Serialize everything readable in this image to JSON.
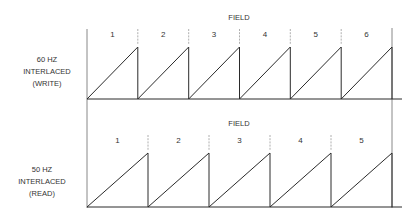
{
  "diagram": {
    "top": {
      "title": "FIELD",
      "side_label": [
        "60  HZ",
        "INTERLACED",
        "(WRITE)"
      ],
      "fields": [
        "1",
        "2",
        "3",
        "4",
        "5",
        "6"
      ]
    },
    "bottom": {
      "title": "FIELD",
      "side_label": [
        "50  HZ",
        "INTERLACED",
        "(READ)"
      ],
      "fields": [
        "1",
        "2",
        "3",
        "4",
        "5"
      ]
    }
  },
  "geometry": {
    "x_start": 87,
    "x_end": 392,
    "axis_extend": 402,
    "top": {
      "baseline": 99,
      "peak": 47,
      "title_y": 20,
      "num_y": 37,
      "div_top": 29,
      "div_bottom": 45
    },
    "bottom": {
      "baseline": 207,
      "peak": 153,
      "title_y": 126,
      "num_y": 143,
      "div_top": 135,
      "div_bottom": 151
    }
  }
}
